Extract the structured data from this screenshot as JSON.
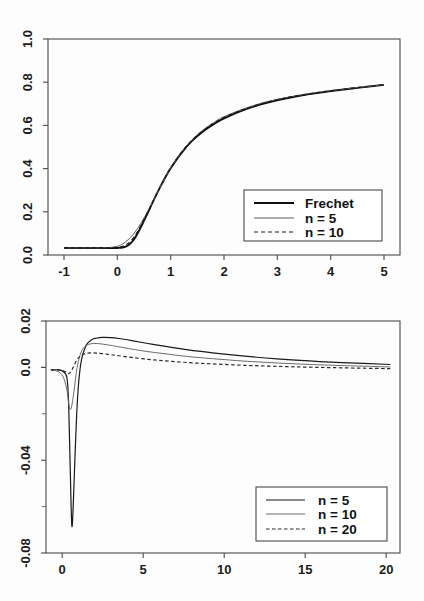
{
  "figure": {
    "background_color": "#fdfdfd",
    "axis_color": "#4a4a4a"
  },
  "chart_data": [
    {
      "id": "top",
      "type": "line",
      "title": "",
      "subtitle": "",
      "xlabel": "",
      "ylabel": "",
      "xlim": [
        -1.3,
        5.3
      ],
      "ylim": [
        -0.035,
        1.035
      ],
      "grid": false,
      "legend_position": "bottom-right",
      "xticks": [
        "-1",
        "0",
        "1",
        "2",
        "3",
        "4",
        "5"
      ],
      "xtick_values": [
        -1,
        0,
        1,
        2,
        3,
        4,
        5
      ],
      "yticks": [
        "0.0",
        "0.2",
        "0.4",
        "0.6",
        "0.8",
        "1.0"
      ],
      "ytick_values": [
        0.0,
        0.2,
        0.4,
        0.6,
        0.8,
        1.0
      ],
      "series": [
        {
          "name": "Frechet",
          "style": "solid-thick",
          "color": "#0e0e0e",
          "x": [
            -1.0,
            -0.8,
            -0.6,
            -0.4,
            -0.2,
            0.0,
            0.1,
            0.2,
            0.3,
            0.4,
            0.5,
            0.6,
            0.7,
            0.8,
            0.9,
            1.0,
            1.2,
            1.4,
            1.6,
            1.8,
            2.0,
            2.4,
            2.8,
            3.2,
            3.6,
            4.0,
            4.4,
            4.8,
            5.0
          ],
          "values": [
            0.0,
            0.0,
            0.0,
            0.0,
            0.0,
            0.0,
            0.002,
            0.012,
            0.038,
            0.082,
            0.135,
            0.19,
            0.247,
            0.3,
            0.35,
            0.395,
            0.47,
            0.53,
            0.576,
            0.612,
            0.642,
            0.686,
            0.719,
            0.743,
            0.762,
            0.777,
            0.79,
            0.802,
            0.808
          ]
        },
        {
          "name": "n = 5",
          "style": "solid-thin",
          "color": "#5d5d5d",
          "x": [
            -1.0,
            -0.8,
            -0.6,
            -0.4,
            -0.2,
            0.0,
            0.1,
            0.2,
            0.3,
            0.4,
            0.5,
            0.6,
            0.7,
            0.8,
            0.9,
            1.0,
            1.2,
            1.4,
            1.6,
            1.8,
            2.0,
            2.4,
            2.8,
            3.2,
            3.6,
            4.0,
            4.4,
            4.8,
            5.0
          ],
          "values": [
            0.0,
            0.0,
            0.0,
            0.0,
            0.001,
            0.008,
            0.02,
            0.04,
            0.068,
            0.104,
            0.148,
            0.197,
            0.248,
            0.3,
            0.35,
            0.397,
            0.474,
            0.536,
            0.583,
            0.62,
            0.65,
            0.692,
            0.724,
            0.747,
            0.765,
            0.78,
            0.792,
            0.803,
            0.809
          ]
        },
        {
          "name": "n = 10",
          "style": "dashed",
          "color": "#1a1a1a",
          "x": [
            -1.0,
            -0.8,
            -0.6,
            -0.4,
            -0.2,
            0.0,
            0.1,
            0.2,
            0.3,
            0.4,
            0.5,
            0.6,
            0.7,
            0.8,
            0.9,
            1.0,
            1.2,
            1.4,
            1.6,
            1.8,
            2.0,
            2.4,
            2.8,
            3.2,
            3.6,
            4.0,
            4.4,
            4.8,
            5.0
          ],
          "values": [
            0.0,
            0.0,
            0.0,
            0.0,
            0.0,
            0.002,
            0.008,
            0.022,
            0.05,
            0.09,
            0.14,
            0.193,
            0.247,
            0.3,
            0.35,
            0.396,
            0.472,
            0.533,
            0.579,
            0.616,
            0.646,
            0.689,
            0.721,
            0.745,
            0.763,
            0.778,
            0.791,
            0.802,
            0.808
          ]
        }
      ]
    },
    {
      "id": "bottom",
      "type": "line",
      "title": "",
      "subtitle": "",
      "xlabel": "",
      "ylabel": "",
      "xlim": [
        -1.3,
        20.6
      ],
      "ylim": [
        -0.088,
        0.0235
      ],
      "grid": false,
      "legend_position": "bottom-right",
      "xticks": [
        "0",
        "5",
        "10",
        "15",
        "20"
      ],
      "xtick_values": [
        0,
        5,
        10,
        15,
        20
      ],
      "yticks": [
        "-0.08",
        "-0.04",
        "0.0",
        "0.02"
      ],
      "ytick_values": [
        -0.08,
        -0.04,
        0.0,
        0.02
      ],
      "ytick_minor_values": [
        -0.06,
        -0.02
      ],
      "series": [
        {
          "name": "n = 5",
          "style": "solid",
          "color": "#1a1a1a",
          "x": [
            -1.0,
            -0.5,
            -0.2,
            0.0,
            0.1,
            0.2,
            0.3,
            0.4,
            0.5,
            0.6,
            0.7,
            0.8,
            0.9,
            1.0,
            1.2,
            1.5,
            1.8,
            2.2,
            2.7,
            3.2,
            4.0,
            5.0,
            6.0,
            7.5,
            9.0,
            11.0,
            13.0,
            15.0,
            17.0,
            20.0
          ],
          "values": [
            0.0,
            0.0,
            -0.001,
            -0.004,
            -0.016,
            -0.048,
            -0.075,
            -0.062,
            -0.04,
            -0.021,
            -0.008,
            0.0,
            0.005,
            0.008,
            0.012,
            0.0144,
            0.0152,
            0.0156,
            0.0155,
            0.0151,
            0.0141,
            0.0127,
            0.0114,
            0.0096,
            0.0082,
            0.0066,
            0.0053,
            0.0043,
            0.0035,
            0.0026
          ]
        },
        {
          "name": "n = 10",
          "style": "thin",
          "color": "#6b6b6b",
          "x": [
            -1.0,
            -0.5,
            -0.2,
            0.0,
            0.1,
            0.2,
            0.3,
            0.4,
            0.5,
            0.6,
            0.7,
            0.8,
            0.9,
            1.0,
            1.2,
            1.5,
            1.8,
            2.2,
            2.7,
            3.2,
            4.0,
            5.0,
            6.0,
            7.5,
            9.0,
            11.0,
            13.0,
            15.0,
            17.0,
            20.0
          ],
          "values": [
            0.0,
            -0.001,
            -0.004,
            -0.01,
            -0.016,
            -0.019,
            -0.017,
            -0.012,
            -0.006,
            0.0,
            0.004,
            0.007,
            0.009,
            0.0104,
            0.0118,
            0.0126,
            0.0127,
            0.0124,
            0.0118,
            0.0111,
            0.01,
            0.0088,
            0.0078,
            0.0064,
            0.0054,
            0.0042,
            0.0033,
            0.0026,
            0.0021,
            0.0014
          ]
        },
        {
          "name": "n = 20",
          "style": "dashed",
          "color": "#2a2a2a",
          "x": [
            -1.0,
            -0.5,
            -0.2,
            0.0,
            0.1,
            0.2,
            0.3,
            0.4,
            0.5,
            0.6,
            0.7,
            0.8,
            0.9,
            1.0,
            1.2,
            1.5,
            1.8,
            2.2,
            2.7,
            3.2,
            4.0,
            5.0,
            6.0,
            7.5,
            9.0,
            11.0,
            13.0,
            15.0,
            17.0,
            20.0
          ],
          "values": [
            0.0,
            0.0,
            -0.0005,
            -0.0015,
            -0.0018,
            -0.0012,
            0.0,
            0.0015,
            0.0032,
            0.0046,
            0.0057,
            0.0065,
            0.0071,
            0.0075,
            0.008,
            0.0082,
            0.0081,
            0.0078,
            0.0073,
            0.0068,
            0.006,
            0.0051,
            0.0044,
            0.0035,
            0.0029,
            0.0022,
            0.0017,
            0.0013,
            0.001,
            0.0006
          ]
        }
      ]
    }
  ],
  "top_chart": {
    "legend": {
      "entries": [
        {
          "label": "Frechet",
          "style": "solid-thick"
        },
        {
          "label": "n = 5",
          "style": "solid-thin"
        },
        {
          "label": "n = 10",
          "style": "dashed"
        }
      ]
    },
    "xticklabels": [
      "-1",
      "0",
      "1",
      "2",
      "3",
      "4",
      "5"
    ],
    "yticklabels": [
      "0.0",
      "0.2",
      "0.4",
      "0.6",
      "0.8",
      "1.0"
    ]
  },
  "bottom_chart": {
    "legend": {
      "entries": [
        {
          "label": "n = 5",
          "style": "solid"
        },
        {
          "label": "n = 10",
          "style": "thin"
        },
        {
          "label": "n = 20",
          "style": "dashed"
        }
      ]
    },
    "xticklabels": [
      "0",
      "5",
      "10",
      "15",
      "20"
    ],
    "yticklabels": [
      "-0.08",
      "-0.04",
      "0.0",
      "0.02"
    ]
  }
}
